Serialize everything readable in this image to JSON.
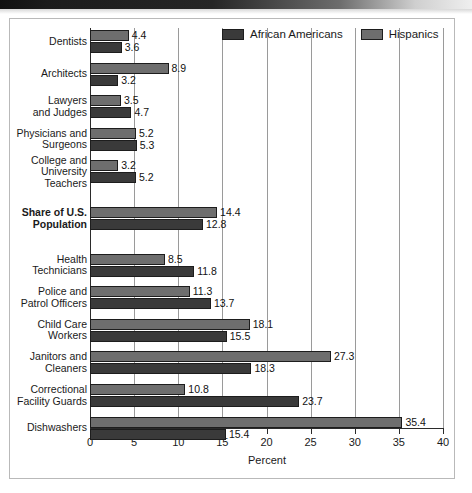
{
  "figure": {
    "axis_title": "Percent",
    "legend": [
      {
        "name": "legend-african-americans",
        "label": "African Americans",
        "color": "#3a3a3a"
      },
      {
        "name": "legend-hispanics",
        "label": "Hispanics",
        "color": "#6e6e6e"
      }
    ]
  },
  "chart_data": {
    "type": "bar",
    "orientation": "horizontal",
    "title": "",
    "xlabel": "Percent",
    "ylabel": "",
    "xlim": [
      0,
      40
    ],
    "xticks": [
      "0",
      "5",
      "10",
      "15",
      "20",
      "25",
      "30",
      "35",
      "40"
    ],
    "grid": true,
    "legend_position": "top-right",
    "categories": [
      "Dentists",
      "Architects",
      "Lawyers and Judges",
      "Physicians and Surgeons",
      "College and University Teachers",
      "Share of U.S. Population",
      "Health Technicians",
      "Police and Patrol Officers",
      "Child Care Workers",
      "Janitors and Cleaners",
      "Correctional Facility Guards",
      "Dishwashers"
    ],
    "category_lines": [
      [
        "Dentists"
      ],
      [
        "Architects"
      ],
      [
        "Lawyers",
        "and Judges"
      ],
      [
        "Physicians and",
        "Surgeons"
      ],
      [
        "College and",
        "University",
        "Teachers"
      ],
      [
        "Share of U.S.",
        "Population"
      ],
      [
        "Health",
        "Technicians"
      ],
      [
        "Police and",
        "Patrol Officers"
      ],
      [
        "Child Care",
        "Workers"
      ],
      [
        "Janitors and",
        "Cleaners"
      ],
      [
        "Correctional",
        "Facility Guards"
      ],
      [
        "Dishwashers"
      ]
    ],
    "emphasized_category": "Share of U.S. Population",
    "series": [
      {
        "name": "Hispanics",
        "color": "#6e6e6e",
        "values": [
          4.4,
          8.9,
          3.5,
          5.2,
          3.2,
          14.4,
          8.5,
          11.3,
          18.1,
          27.3,
          10.8,
          35.4
        ]
      },
      {
        "name": "African Americans",
        "color": "#3a3a3a",
        "values": [
          3.6,
          3.2,
          4.7,
          5.3,
          5.2,
          12.8,
          11.8,
          13.7,
          15.5,
          18.3,
          23.7,
          15.4
        ]
      }
    ]
  }
}
